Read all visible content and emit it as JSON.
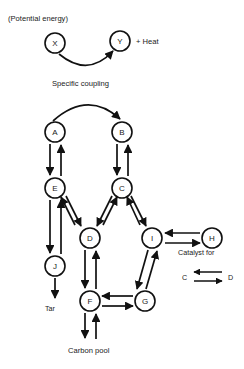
{
  "diagram": {
    "stroke_color": "#111111",
    "background": "#ffffff",
    "nodes": [
      {
        "id": "X",
        "label": "X",
        "cx": 55,
        "cy": 43,
        "r": 10
      },
      {
        "id": "Y",
        "label": "Y",
        "cx": 120,
        "cy": 41,
        "r": 10
      },
      {
        "id": "A",
        "label": "A",
        "cx": 55,
        "cy": 132,
        "r": 10
      },
      {
        "id": "B",
        "label": "B",
        "cx": 122,
        "cy": 132,
        "r": 10
      },
      {
        "id": "E",
        "label": "E",
        "cx": 55,
        "cy": 188,
        "r": 10
      },
      {
        "id": "C",
        "label": "C",
        "cx": 122,
        "cy": 188,
        "r": 10
      },
      {
        "id": "D",
        "label": "D",
        "cx": 90,
        "cy": 238,
        "r": 10
      },
      {
        "id": "I",
        "label": "I",
        "cx": 152,
        "cy": 238,
        "r": 10
      },
      {
        "id": "H",
        "label": "H",
        "cx": 212,
        "cy": 238,
        "r": 10
      },
      {
        "id": "J",
        "label": "J",
        "cx": 55,
        "cy": 266,
        "r": 10
      },
      {
        "id": "F",
        "label": "F",
        "cx": 90,
        "cy": 301,
        "r": 10
      },
      {
        "id": "G",
        "label": "G",
        "cx": 145,
        "cy": 301,
        "r": 10
      }
    ],
    "annotations": {
      "potential_energy": "(Potential energy)",
      "plus_heat": "+ Heat",
      "specific_coupling": "Specific coupling",
      "catalyst_for": "Catalyst for",
      "catalyst_left": "C",
      "catalyst_right": "D",
      "tar": "Tar",
      "carbon_pool": "Carbon pool"
    },
    "edges": [
      {
        "from": "X",
        "to": "Y",
        "style": "curved-down",
        "direction": "one-way"
      },
      {
        "from": "A",
        "to": "B",
        "style": "curved-up",
        "direction": "one-way"
      },
      {
        "from": "A",
        "to": "E",
        "style": "vertical",
        "direction": "two-way"
      },
      {
        "from": "B",
        "to": "C",
        "style": "vertical",
        "direction": "two-way"
      },
      {
        "from": "E",
        "to": "D",
        "style": "diagonal",
        "direction": "two-way"
      },
      {
        "from": "C",
        "to": "D",
        "style": "diagonal",
        "direction": "two-way"
      },
      {
        "from": "C",
        "to": "I",
        "style": "diagonal",
        "direction": "two-way"
      },
      {
        "from": "E",
        "to": "J",
        "style": "vertical",
        "direction": "two-way"
      },
      {
        "from": "D",
        "to": "F",
        "style": "vertical",
        "direction": "two-way"
      },
      {
        "from": "I",
        "to": "G",
        "style": "diagonal",
        "direction": "two-way"
      },
      {
        "from": "I",
        "to": "H",
        "style": "horizontal",
        "direction": "two-way"
      },
      {
        "from": "F",
        "to": "G",
        "style": "horizontal",
        "direction": "two-way"
      },
      {
        "from": "J",
        "to": "Tar",
        "style": "vertical",
        "direction": "one-way"
      },
      {
        "from": "F",
        "to": "CarbonPool",
        "style": "vertical",
        "direction": "two-way"
      }
    ]
  }
}
